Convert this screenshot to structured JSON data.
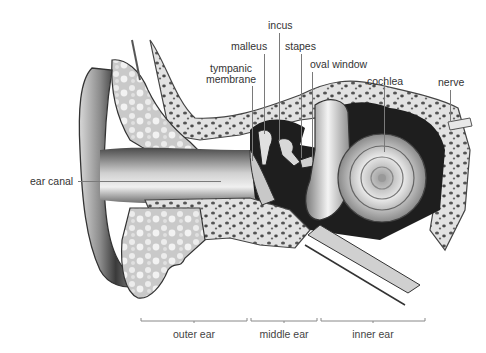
{
  "diagram": {
    "colors": {
      "background": "#ffffff",
      "tissue": "#b8b8b8",
      "bone": "#e4e4e4",
      "bone_pores": "#5a5a5a",
      "cavity": "#1e1e1e",
      "label_text": "#333333",
      "leader_line": "#7a7a7a"
    },
    "labels": {
      "incus": "incus",
      "malleus": "malleus",
      "stapes": "stapes",
      "tympanic_membrane_line1": "tympanic",
      "tympanic_membrane_line2": "membrane",
      "oval_window": "oval window",
      "cochlea": "cochlea",
      "nerve": "nerve",
      "ear_canal": "ear canal"
    },
    "regions": [
      {
        "label": "outer ear"
      },
      {
        "label": "middle ear"
      },
      {
        "label": "inner ear"
      }
    ]
  }
}
